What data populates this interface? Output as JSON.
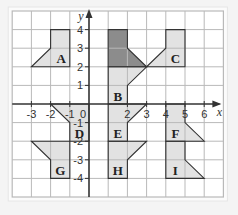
{
  "diagram": {
    "type": "coordinate-grid-transformations",
    "axes": {
      "x_label": "x",
      "y_label": "y",
      "x_ticks": [
        "-3",
        "-2",
        "-1",
        "0",
        "2",
        "3",
        "4",
        "5",
        "6"
      ],
      "y_ticks": [
        "4",
        "3",
        "2",
        "1",
        "-1",
        "-2",
        "-3",
        "-4"
      ],
      "x_range": [
        -4,
        7
      ],
      "y_range": [
        -5,
        5
      ]
    },
    "colors": {
      "background": "#f4f4f4",
      "grid_bg": "#ffffff",
      "grid_line": "#b9b9b9",
      "axis": "#333333",
      "shape_fill": "#e2e2e2",
      "shape_fill_dark": "#8c8c8c",
      "shape_stroke": "#333333"
    },
    "shapes": [
      {
        "label": "A",
        "points": [
          [
            -3,
            2
          ],
          [
            -1,
            2
          ],
          [
            -1,
            4
          ],
          [
            -2,
            4
          ],
          [
            -2,
            3
          ]
        ],
        "label_at": [
          -1.45,
          2.45
        ],
        "dark": false
      },
      {
        "label": "",
        "points": [
          [
            1,
            4
          ],
          [
            2,
            4
          ],
          [
            2,
            3
          ],
          [
            3,
            2
          ],
          [
            1,
            2
          ]
        ],
        "label_at": null,
        "dark": true
      },
      {
        "label": "B",
        "points": [
          [
            1,
            2
          ],
          [
            3,
            2
          ],
          [
            2,
            1
          ],
          [
            2,
            0
          ],
          [
            1,
            0
          ]
        ],
        "label_at": [
          1.5,
          0.45
        ],
        "dark": false
      },
      {
        "label": "C",
        "points": [
          [
            3,
            2
          ],
          [
            5,
            2
          ],
          [
            5,
            4
          ],
          [
            4,
            4
          ],
          [
            4,
            3
          ]
        ],
        "label_at": [
          4.5,
          2.45
        ],
        "dark": false
      },
      {
        "label": "D",
        "points": [
          [
            -2,
            0
          ],
          [
            0,
            0
          ],
          [
            0,
            -2
          ],
          [
            -1,
            -2
          ],
          [
            -1,
            -1
          ]
        ],
        "label_at": [
          -0.5,
          -1.55
        ],
        "dark": false
      },
      {
        "label": "E",
        "points": [
          [
            1,
            0
          ],
          [
            3,
            0
          ],
          [
            2,
            -1
          ],
          [
            2,
            -2
          ],
          [
            1,
            -2
          ]
        ],
        "label_at": [
          1.5,
          -1.55
        ],
        "dark": false
      },
      {
        "label": "F",
        "points": [
          [
            4,
            0
          ],
          [
            5,
            0
          ],
          [
            5,
            -1
          ],
          [
            6,
            -2
          ],
          [
            4,
            -2
          ]
        ],
        "label_at": [
          4.5,
          -1.55
        ],
        "dark": false
      },
      {
        "label": "G",
        "points": [
          [
            -3,
            -2
          ],
          [
            -1,
            -2
          ],
          [
            -1,
            -4
          ],
          [
            -2,
            -4
          ],
          [
            -2,
            -3
          ]
        ],
        "label_at": [
          -1.5,
          -3.55
        ],
        "dark": false
      },
      {
        "label": "H",
        "points": [
          [
            1,
            -2
          ],
          [
            3,
            -2
          ],
          [
            2,
            -3
          ],
          [
            2,
            -4
          ],
          [
            1,
            -4
          ]
        ],
        "label_at": [
          1.5,
          -3.55
        ],
        "dark": false
      },
      {
        "label": "I",
        "points": [
          [
            4,
            -2
          ],
          [
            5,
            -2
          ],
          [
            5,
            -3
          ],
          [
            6,
            -4
          ],
          [
            4,
            -4
          ]
        ],
        "label_at": [
          4.5,
          -3.55
        ],
        "dark": false
      }
    ]
  }
}
